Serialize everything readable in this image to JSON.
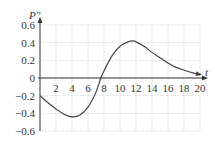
{
  "chart_data": {
    "type": "line",
    "title": "",
    "xlabel": "t",
    "ylabel": "P''",
    "xlim": [
      0,
      20
    ],
    "ylim": [
      -0.6,
      0.6
    ],
    "grid": true,
    "x_ticks": [
      "2",
      "4",
      "6",
      "8",
      "10",
      "12",
      "14",
      "16",
      "18",
      "20"
    ],
    "y_ticks": [
      "0.6",
      "0.4",
      "0.2",
      "0",
      "−0.2",
      "−0.4",
      "−0.6"
    ],
    "series": [
      {
        "name": "P''",
        "x": [
          0,
          1,
          2,
          3,
          4,
          5,
          6,
          7,
          7.6,
          8,
          9,
          10,
          11,
          11.7,
          12,
          13,
          14,
          15,
          16,
          17,
          18,
          19,
          20
        ],
        "values": [
          -0.2,
          -0.28,
          -0.35,
          -0.41,
          -0.44,
          -0.42,
          -0.33,
          -0.16,
          0,
          0.08,
          0.25,
          0.36,
          0.41,
          0.42,
          0.41,
          0.36,
          0.29,
          0.23,
          0.17,
          0.12,
          0.09,
          0.06,
          0.04
        ]
      }
    ]
  }
}
